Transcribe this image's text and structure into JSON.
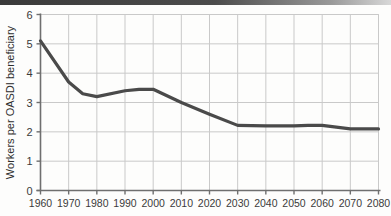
{
  "chart_data": {
    "type": "line",
    "title": "",
    "subtitle": "",
    "xlabel": "",
    "ylabel": "Workers per OASDI beneficiary",
    "xlim": [
      1960,
      2080
    ],
    "ylim": [
      0,
      6
    ],
    "grid": true,
    "legend_position": "none",
    "series_color": "#4a4a4a",
    "x": [
      1960,
      1970,
      1975,
      1980,
      1990,
      1995,
      2000,
      2010,
      2020,
      2030,
      2040,
      2050,
      2055,
      2060,
      2070,
      2080
    ],
    "series": [
      {
        "name": "Workers per OASDI beneficiary",
        "values": [
          5.1,
          3.7,
          3.3,
          3.2,
          3.4,
          3.45,
          3.45,
          3.0,
          2.6,
          2.22,
          2.2,
          2.2,
          2.22,
          2.22,
          2.1,
          2.1
        ]
      }
    ],
    "y_ticks": [
      0,
      1,
      2,
      3,
      4,
      5,
      6
    ],
    "y_tick_labels": [
      "0",
      "1",
      "2",
      "3",
      "4",
      "5",
      "6"
    ],
    "x_ticks": [
      1960,
      1970,
      1980,
      1990,
      2000,
      2010,
      2020,
      2030,
      2040,
      2050,
      2060,
      2070,
      2080
    ],
    "x_tick_labels": [
      "1960",
      "1970",
      "1980",
      "1990",
      "2000",
      "2010",
      "2020",
      "2030",
      "2040",
      "2050",
      "2060",
      "2070",
      "2080"
    ],
    "annotations": []
  },
  "colors": {
    "line": "#4a4a4a",
    "axis": "#6f6f6f",
    "grid": "#c9c9c9",
    "text": "#3b3b3b",
    "background": "#fdfdfc"
  }
}
